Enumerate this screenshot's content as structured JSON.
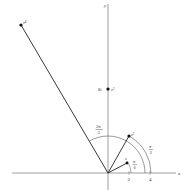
{
  "axes": {
    "x_label": "x",
    "y_label": "y"
  },
  "ticks": {
    "two": "2",
    "four": "4"
  },
  "points": {
    "z1": {
      "label": "z",
      "sup": ""
    },
    "z2": {
      "label": "z",
      "sup": "2"
    },
    "z3": {
      "label": "z",
      "sup": "3",
      "value_label": "8i"
    },
    "z4": {
      "label": "z",
      "sup": "4"
    }
  },
  "angles": {
    "pi_over_6": {
      "num": "π",
      "den": "6"
    },
    "pi_over_3": {
      "num": "π",
      "den": "3"
    },
    "two_pi_over_3": {
      "num": "2π",
      "den": "3"
    }
  },
  "colors": {
    "stroke": "#222222",
    "axis": "#777777"
  }
}
